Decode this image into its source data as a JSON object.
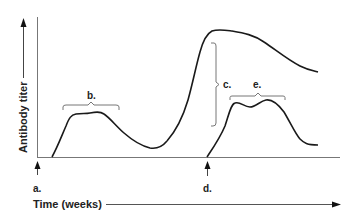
{
  "figure": {
    "y_axis_label": "Antibody titer",
    "x_axis_label": "Time (weeks)",
    "labels": {
      "a": "a.",
      "b": "b.",
      "c": "c.",
      "d": "d.",
      "e": "e."
    },
    "colors": {
      "ink": "#1a1a1a",
      "axis": "#555555",
      "bracket": "#666666",
      "background": "#ffffff"
    }
  }
}
